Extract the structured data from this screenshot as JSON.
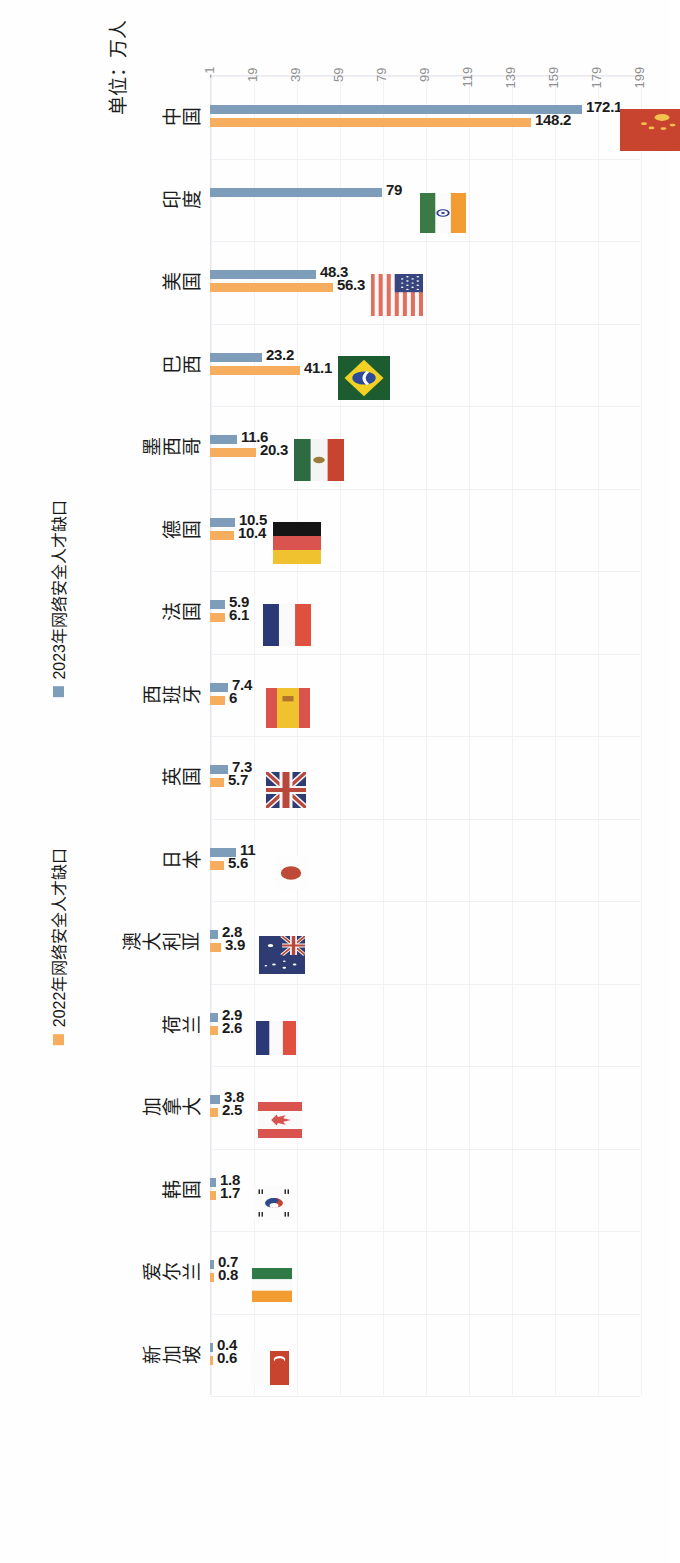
{
  "chart_data": {
    "type": "bar",
    "title": "",
    "xlabel": "",
    "ylabel": "单位：万人",
    "ylim": [
      -1,
      199
    ],
    "yticks": [
      -1,
      19,
      39,
      59,
      79,
      99,
      119,
      139,
      159,
      179,
      199
    ],
    "grid": true,
    "legend_position": "bottom",
    "orientation": "vertical-bar-rotated-90cw",
    "categories": [
      "中国",
      "印度",
      "美国",
      "巴西",
      "墨西哥",
      "德国",
      "法国",
      "西班牙",
      "英国",
      "日本",
      "澳大利亚",
      "荷兰",
      "加拿大",
      "韩国",
      "爱尔兰",
      "新加坡"
    ],
    "series": [
      {
        "name": "2023年网络安全人才缺口",
        "color": "#7e9dbb",
        "values": [
          172.1,
          79,
          48.3,
          23.2,
          11.6,
          10.5,
          5.9,
          7.4,
          7.3,
          11,
          2.8,
          2.9,
          3.8,
          1.8,
          0.7,
          0.4
        ]
      },
      {
        "name": "2022年网络安全人才缺口",
        "color": "#f7ad5e",
        "values": [
          148.2,
          0,
          56.3,
          41.1,
          20.3,
          10.4,
          6.1,
          6,
          5.7,
          5.6,
          3.9,
          2.6,
          2.5,
          1.7,
          0.8,
          0.6
        ]
      }
    ]
  },
  "axis": {
    "title": "单位：万人",
    "tick_labels": [
      "199",
      "179",
      "159",
      "139",
      "119",
      "99",
      "79",
      "59",
      "39",
      "19",
      "-1"
    ]
  },
  "legend": {
    "items": [
      {
        "label": "2023年网络安全人才缺口",
        "color": "#7e9dbb",
        "marker": "square-marker"
      },
      {
        "label": "2022年网络安全人才缺口",
        "color": "#f7ad5e",
        "marker": "square-marker"
      }
    ]
  },
  "countries": [
    {
      "name": "中国",
      "flag": "china-flag",
      "v2023": "172.1",
      "v2022": "148.2"
    },
    {
      "name": "印度",
      "flag": "india-flag",
      "v2023": "79",
      "v2022": ""
    },
    {
      "name": "美国",
      "flag": "usa-flag",
      "v2023": "48.3",
      "v2022": "56.3"
    },
    {
      "name": "巴西",
      "flag": "brazil-flag",
      "v2023": "23.2",
      "v2022": "41.1"
    },
    {
      "name": "墨西哥",
      "flag": "mexico-flag",
      "v2023": "11.6",
      "v2022": "20.3"
    },
    {
      "name": "德国",
      "flag": "germany-flag",
      "v2023": "10.5",
      "v2022": "10.4"
    },
    {
      "name": "法国",
      "flag": "netherlands-flag",
      "v2023": "5.9",
      "v2022": "6.1"
    },
    {
      "name": "西班牙",
      "flag": "spain-flag",
      "v2023": "7.4",
      "v2022": "6"
    },
    {
      "name": "英国",
      "flag": "uk-flag",
      "v2023": "7.3",
      "v2022": "5.7"
    },
    {
      "name": "日本",
      "flag": "japan-flag",
      "v2023": "11",
      "v2022": "5.6"
    },
    {
      "name": "澳大利亚",
      "flag": "australia-flag",
      "v2023": "2.8",
      "v2022": "3.9"
    },
    {
      "name": "荷兰",
      "flag": "netherlands2-flag",
      "v2023": "2.9",
      "v2022": "2.6"
    },
    {
      "name": "加拿大",
      "flag": "canada-flag",
      "v2023": "3.8",
      "v2022": "2.5"
    },
    {
      "name": "韩国",
      "flag": "southkorea-flag",
      "v2023": "1.8",
      "v2022": "1.7"
    },
    {
      "name": "爱尔兰",
      "flag": "ireland-flag",
      "v2023": "0.7",
      "v2022": "0.8"
    },
    {
      "name": "新加坡",
      "flag": "singapore-flag",
      "v2023": "0.4",
      "v2022": "0.6"
    }
  ]
}
